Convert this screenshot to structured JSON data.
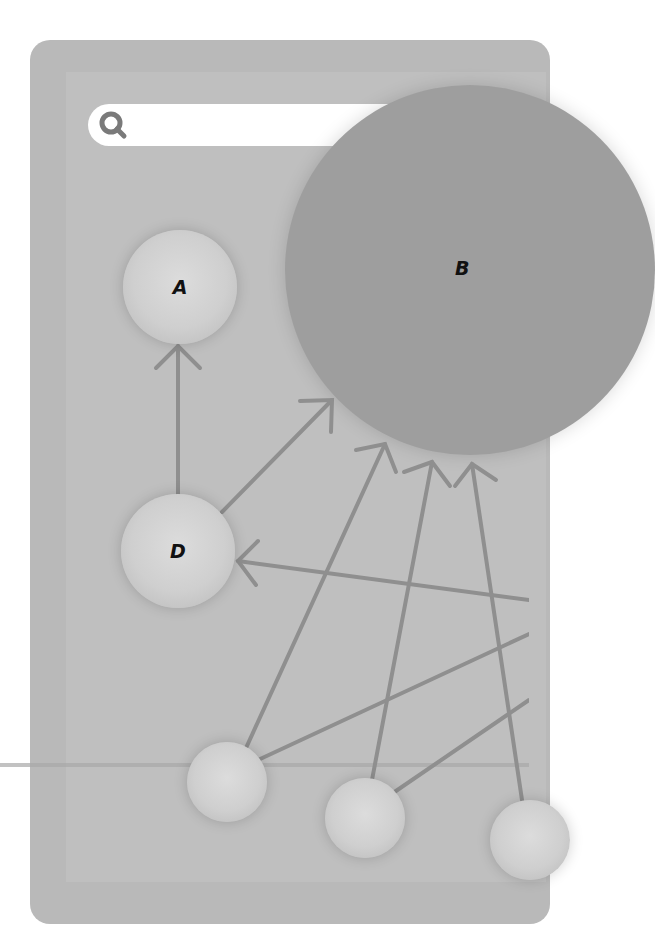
{
  "search": {
    "placeholder": "",
    "icon": "search-icon"
  },
  "nodes": [
    {
      "id": "A",
      "label": "A",
      "cx": 180,
      "cy": 287,
      "r": 57
    },
    {
      "id": "B",
      "label": "B",
      "cx": 470,
      "cy": 270,
      "r": 185
    },
    {
      "id": "D",
      "label": "D",
      "cx": 178,
      "cy": 551,
      "r": 57
    },
    {
      "id": "n1",
      "label": "",
      "cx": 227,
      "cy": 782,
      "r": 40
    },
    {
      "id": "n2",
      "label": "",
      "cx": 365,
      "cy": 818,
      "r": 40
    },
    {
      "id": "n3",
      "label": "",
      "cx": 530,
      "cy": 840,
      "r": 40
    }
  ],
  "edges": [
    {
      "from": "D",
      "to": "A"
    },
    {
      "from": "D",
      "to": "B"
    },
    {
      "from": "n1",
      "to": "B"
    },
    {
      "from": "n2",
      "to": "B"
    },
    {
      "from": "n3",
      "to": "B"
    },
    {
      "from": "offscreen-right",
      "to": "D"
    },
    {
      "from": "n1",
      "to": "offscreen-right"
    },
    {
      "from": "n2",
      "to": "offscreen-right"
    },
    {
      "from": "offscreen-right",
      "to": "B"
    }
  ],
  "colors": {
    "background": "#ffffff",
    "panel": "#b9b9b9",
    "edge": "#8f8f8f",
    "node_big": "#9e9e9e",
    "search_icon": "#7a7a7a"
  }
}
